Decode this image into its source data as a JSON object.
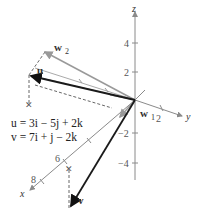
{
  "axes": {
    "x_label": "x",
    "y_label": "y",
    "z_label": "z",
    "x_ticks": [
      "6",
      "8"
    ],
    "y_ticks": [
      "2"
    ],
    "z_ticks": [
      "4",
      "2",
      "−2",
      "−4"
    ]
  },
  "vectors": {
    "u_label": "u",
    "v_label": "v",
    "w1_label": "w",
    "w1_sub": "1",
    "w2_label": "w",
    "w2_sub": "2"
  },
  "equations": {
    "u_eq": "u = 3i − 5j + 2k",
    "v_eq": "v = 7i + j − 2k"
  },
  "colors": {
    "axis": "#8a8a8a",
    "vector_dark": "#1a1a1a",
    "vector_gray": "#9a9a9a",
    "dashed": "#555555"
  }
}
